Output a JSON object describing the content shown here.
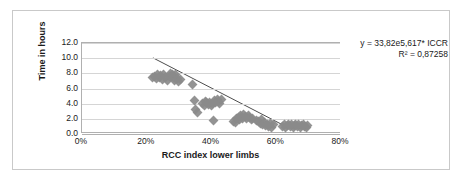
{
  "chart_data": {
    "type": "scatter",
    "title": "",
    "xlabel": "RCC index lower limbs",
    "ylabel": "Time in hours",
    "xlim": [
      0,
      80
    ],
    "ylim": [
      0,
      12
    ],
    "xticks": [
      "0%",
      "20%",
      "40%",
      "60%",
      "80%"
    ],
    "xtick_values": [
      0,
      20,
      40,
      60,
      80
    ],
    "yticks": [
      "0.0",
      "2.0",
      "4.0",
      "6.0",
      "8.0",
      "10.0",
      "12.0"
    ],
    "ytick_values": [
      0,
      2,
      4,
      6,
      8,
      10,
      12
    ],
    "grid": "horizontal",
    "legend": "none",
    "marker_color": "#8a8a8a",
    "marker_shape": "diamond",
    "trendline_color": "#4a4a4a",
    "annotations": [
      "y = 33,82e5,617* ICCR",
      "R² = 0,87258"
    ],
    "equation": "y = 33,82e5,617* ICCR",
    "r_squared": "R² = 0,87258",
    "trendline": {
      "x": [
        22.0,
        62.5
      ],
      "y": [
        10.0,
        0.9
      ]
    },
    "points": [
      [
        21.8,
        7.4
      ],
      [
        22.4,
        7.6
      ],
      [
        22.9,
        7.3
      ],
      [
        23.4,
        7.8
      ],
      [
        23.8,
        7.5
      ],
      [
        24.3,
        7.7
      ],
      [
        24.8,
        7.2
      ],
      [
        25.2,
        7.9
      ],
      [
        25.8,
        7.4
      ],
      [
        26.3,
        7.0
      ],
      [
        26.9,
        7.6
      ],
      [
        27.4,
        8.0
      ],
      [
        27.8,
        7.9
      ],
      [
        28.2,
        7.5
      ],
      [
        28.6,
        7.1
      ],
      [
        29.0,
        7.8
      ],
      [
        29.4,
        7.3
      ],
      [
        29.9,
        6.9
      ],
      [
        30.4,
        7.2
      ],
      [
        34.2,
        6.5
      ],
      [
        34.6,
        4.4
      ],
      [
        35.1,
        3.2
      ],
      [
        35.6,
        2.9
      ],
      [
        37.2,
        4.0
      ],
      [
        37.7,
        3.8
      ],
      [
        38.1,
        4.3
      ],
      [
        38.6,
        4.1
      ],
      [
        39.0,
        3.9
      ],
      [
        39.5,
        4.2
      ],
      [
        39.9,
        3.7
      ],
      [
        40.3,
        4.0
      ],
      [
        40.8,
        4.4
      ],
      [
        41.2,
        4.2
      ],
      [
        41.7,
        4.6
      ],
      [
        42.1,
        4.3
      ],
      [
        42.6,
        4.0
      ],
      [
        43.0,
        4.5
      ],
      [
        40.6,
        1.8
      ],
      [
        46.8,
        1.6
      ],
      [
        47.3,
        1.5
      ],
      [
        47.8,
        2.0
      ],
      [
        48.2,
        2.2
      ],
      [
        48.7,
        1.9
      ],
      [
        49.1,
        2.4
      ],
      [
        49.6,
        2.1
      ],
      [
        50.0,
        2.6
      ],
      [
        50.5,
        2.3
      ],
      [
        50.9,
        2.0
      ],
      [
        51.4,
        2.5
      ],
      [
        51.8,
        2.2
      ],
      [
        52.3,
        1.9
      ],
      [
        52.8,
        2.1
      ],
      [
        54.0,
        1.8
      ],
      [
        54.5,
        1.6
      ],
      [
        55.0,
        1.4
      ],
      [
        55.4,
        1.9
      ],
      [
        55.9,
        1.2
      ],
      [
        56.3,
        1.5
      ],
      [
        56.8,
        1.1
      ],
      [
        57.2,
        1.3
      ],
      [
        57.7,
        1.0
      ],
      [
        58.1,
        1.4
      ],
      [
        58.6,
        0.9
      ],
      [
        59.0,
        1.2
      ],
      [
        62.0,
        1.0
      ],
      [
        62.5,
        1.2
      ],
      [
        63.0,
        0.9
      ],
      [
        63.4,
        1.1
      ],
      [
        63.9,
        1.3
      ],
      [
        64.3,
        1.0
      ],
      [
        64.8,
        1.2
      ],
      [
        65.2,
        0.9
      ],
      [
        65.7,
        1.1
      ],
      [
        66.1,
        1.3
      ],
      [
        66.6,
        1.0
      ],
      [
        67.0,
        1.2
      ],
      [
        67.5,
        0.9
      ],
      [
        67.9,
        1.1
      ],
      [
        68.4,
        1.3
      ],
      [
        68.8,
        1.0
      ],
      [
        69.3,
        0.8
      ],
      [
        69.7,
        1.1
      ]
    ]
  }
}
